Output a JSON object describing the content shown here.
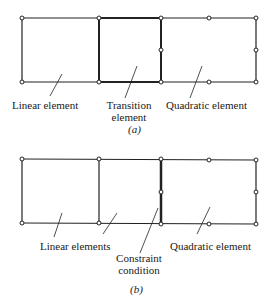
{
  "figure_a": {
    "caption": "(a)",
    "labels": {
      "linear": "Linear element",
      "transition_line1": "Transition",
      "transition_line2": "element",
      "quadratic": "Quadratic element"
    }
  },
  "figure_b": {
    "caption": "(b)",
    "labels": {
      "linear": "Linear elements",
      "constraint_line1": "Constraint",
      "constraint_line2": "condition",
      "quadratic": "Quadratic element"
    }
  }
}
